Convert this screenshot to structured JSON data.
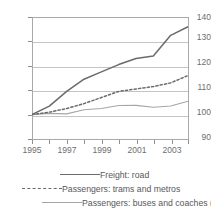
{
  "chart_data": {
    "type": "line",
    "title": "",
    "xlabel": "",
    "ylabel": "",
    "x": [
      1995,
      1996,
      1997,
      1998,
      1999,
      2000,
      2001,
      2002,
      2003,
      2004
    ],
    "xlim": [
      1995,
      2004
    ],
    "ylim": [
      90,
      140
    ],
    "yticks": [
      90,
      100,
      110,
      120,
      130,
      140
    ],
    "xticks": [
      1995,
      1996,
      1997,
      1998,
      1999,
      2000,
      2001,
      2002,
      2003,
      2004
    ],
    "xticklabels": [
      "1995",
      "",
      "1997",
      "",
      "1999",
      "",
      "2001",
      "",
      "2003",
      ""
    ],
    "grid": true,
    "legend_position": "bottom",
    "series": [
      {
        "name": "Freight: road",
        "style": "solid",
        "color": "#6b6b6d",
        "values": [
          100.0,
          103.5,
          109.5,
          114.5,
          117.5,
          120.5,
          123.0,
          124.0,
          132.5,
          136.0
        ]
      },
      {
        "name": "Passengers: trams and metros",
        "style": "dashed",
        "color": "#6b6b6d",
        "values": [
          100.0,
          101.0,
          102.5,
          104.5,
          107.0,
          109.5,
          110.5,
          111.5,
          113.0,
          116.0
        ]
      },
      {
        "name": "Passengers: buses and coaches (1)",
        "style": "solid",
        "color": "#a6a6a8",
        "values": [
          100.0,
          100.5,
          100.3,
          102.0,
          102.5,
          103.7,
          103.8,
          103.0,
          103.5,
          105.5
        ]
      }
    ]
  },
  "axis": {
    "y_labels": [
      "140",
      "130",
      "120",
      "110",
      "100",
      "90"
    ],
    "x_labels": [
      "1995",
      "1997",
      "1999",
      "2001",
      "2003"
    ]
  },
  "legend": {
    "items": [
      {
        "label": "Freight: road"
      },
      {
        "label": "Passengers: trams and metros"
      },
      {
        "label": "Passengers: buses and coaches (1)"
      }
    ]
  },
  "colors": {
    "freight": "#6b6b6d",
    "trams": "#6b6b6d",
    "buses": "#a6a6a8",
    "grid": "#c4c4c6",
    "frame": "#a9a9ab",
    "text": "#58585a"
  }
}
